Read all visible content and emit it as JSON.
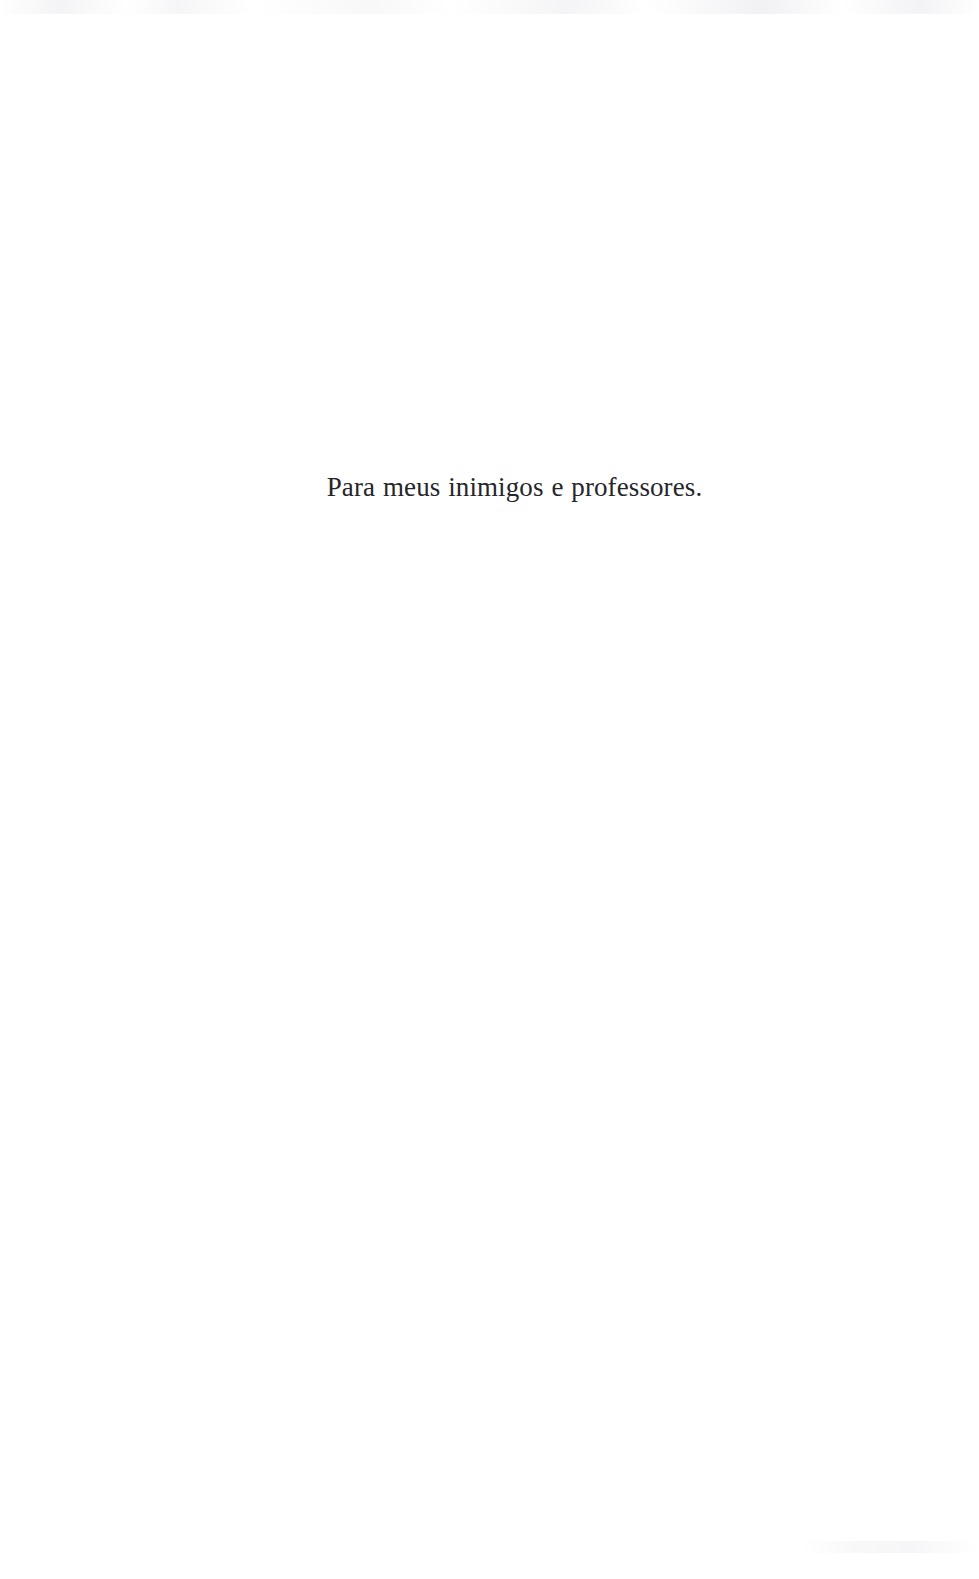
{
  "document": {
    "type": "book-dedication-page",
    "page_background_color": "#ffffff",
    "text_color": "#26262a",
    "language": "pt-BR"
  },
  "dedication": {
    "text": "Para meus inimigos e professores.",
    "alignment": "center",
    "vertical_position_percent": 31
  }
}
